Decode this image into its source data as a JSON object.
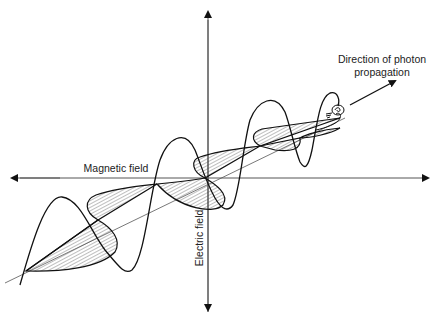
{
  "diagram": {
    "labels": {
      "direction_line1": "Direction of photon",
      "direction_line2": "propagation",
      "magnetic_field": "Magnetic field",
      "electric_field": "Electric field"
    },
    "colors": {
      "background": "#ffffff",
      "stroke": "#111111",
      "axis": "#555555",
      "hatch": "#444444"
    },
    "elements": [
      "vertical-axis-arrow",
      "horizontal-axis-arrow",
      "propagation-axis",
      "electric-field-wave",
      "magnetic-field-wave-hatched",
      "photon-spiral-icon",
      "propagation-direction-arrow"
    ]
  }
}
